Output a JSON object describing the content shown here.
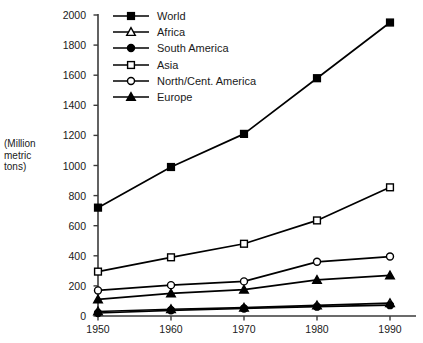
{
  "chart_data": {
    "type": "line",
    "title": "",
    "xlabel": "",
    "ylabel": "(Million metric tons)",
    "ylabel_lines": [
      "(Million",
      "metric",
      "tons)"
    ],
    "x": [
      1950,
      1960,
      1970,
      1980,
      1990
    ],
    "xtick_labels": [
      "1950",
      "1960",
      "1970",
      "1980",
      "1990"
    ],
    "ytick_labels": [
      "0",
      "200",
      "400",
      "600",
      "800",
      "1000",
      "1200",
      "1400",
      "1600",
      "1800",
      "2000"
    ],
    "ytick_values": [
      0,
      200,
      400,
      600,
      800,
      1000,
      1200,
      1400,
      1600,
      1800,
      2000
    ],
    "ylim": [
      0,
      2000
    ],
    "xlim": [
      1945,
      1995
    ],
    "grid": false,
    "legend_position": "top-left-inside",
    "series": [
      {
        "name": "World",
        "marker": "filled-square",
        "color": "#000000",
        "values": [
          720,
          990,
          1210,
          1580,
          1950
        ]
      },
      {
        "name": "Africa",
        "marker": "open-triangle",
        "color": "#000000",
        "values": [
          30,
          45,
          55,
          70,
          85
        ]
      },
      {
        "name": "South America",
        "marker": "filled-circle",
        "color": "#000000",
        "values": [
          20,
          38,
          50,
          62,
          72
        ]
      },
      {
        "name": "Asia",
        "marker": "open-square",
        "color": "#000000",
        "values": [
          295,
          390,
          480,
          635,
          855
        ]
      },
      {
        "name": "North/Cent. America",
        "marker": "open-circle",
        "color": "#000000",
        "values": [
          170,
          205,
          230,
          360,
          395
        ]
      },
      {
        "name": "Europe",
        "marker": "filled-triangle",
        "color": "#000000",
        "values": [
          110,
          150,
          175,
          240,
          270
        ]
      }
    ]
  },
  "geometry": {
    "plot_left": 98,
    "plot_right": 390,
    "plot_top": 15,
    "plot_bottom": 316,
    "axis_color": "#3a3a3a"
  }
}
